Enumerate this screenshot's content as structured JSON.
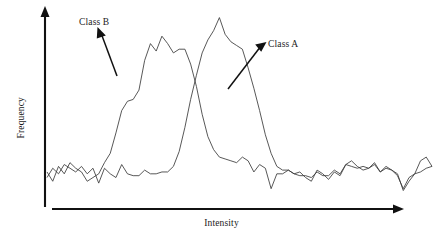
{
  "figure": {
    "background": "#ffffff",
    "axis_color": "#111111",
    "curve_color": "#3a3a3a"
  },
  "axes": {
    "x_label": "Intensity",
    "y_label": "Frequency",
    "x_axis_name": "x-axis-arrow",
    "y_axis_name": "y-axis-arrow"
  },
  "annotations": [
    {
      "label": "Class B",
      "target": "class-b-curve"
    },
    {
      "label": "Class A",
      "target": "class-a-curve"
    }
  ],
  "labels": {
    "class_a": "Class A",
    "class_b": "Class B"
  },
  "chart_data": {
    "type": "line",
    "title": "",
    "subtitle": "",
    "xlabel": "Intensity",
    "ylabel": "Frequency",
    "grid": false,
    "legend_position": "inline-annotations",
    "axis_style": "arrow-axes-no-ticks",
    "xlim": [
      0,
      100
    ],
    "ylim": [
      0,
      100
    ],
    "x": [
      0,
      1.49,
      2.99,
      4.48,
      5.97,
      7.46,
      8.96,
      10.45,
      11.94,
      13.43,
      14.93,
      16.42,
      17.91,
      19.4,
      20.9,
      22.39,
      23.88,
      25.37,
      26.87,
      28.36,
      29.85,
      31.34,
      32.84,
      34.33,
      35.82,
      37.31,
      38.81,
      40.3,
      41.79,
      43.28,
      44.78,
      46.27,
      47.76,
      49.25,
      50.75,
      52.24,
      53.73,
      55.22,
      56.72,
      58.21,
      59.7,
      61.19,
      62.69,
      64.18,
      65.67,
      67.16,
      68.66,
      70.15,
      71.64,
      73.13,
      74.63,
      76.12,
      77.61,
      79.1,
      80.6,
      82.09,
      83.58,
      85.07,
      86.57,
      88.06,
      89.55,
      91.04,
      92.54,
      94.03,
      95.52,
      97.01,
      98.51,
      100
    ],
    "series": [
      {
        "name": "Class B",
        "values": [
          14,
          9,
          17,
          13,
          19,
          16,
          14,
          9,
          11,
          13,
          19,
          24,
          35,
          47,
          52,
          53,
          58,
          74,
          83,
          79,
          87,
          83,
          78,
          80,
          80,
          72,
          60,
          45,
          33,
          26,
          22,
          21,
          20,
          19,
          22,
          20,
          14,
          18,
          16,
          5,
          13,
          13,
          15,
          13,
          14,
          11,
          9,
          15,
          13,
          10,
          14,
          12,
          18,
          20,
          17,
          15,
          16,
          19,
          14,
          16,
          15,
          13,
          4,
          9,
          13,
          20,
          22,
          17
        ]
      },
      {
        "name": "Class A",
        "values": [
          11,
          16,
          13,
          18,
          16,
          14,
          17,
          13,
          16,
          8,
          16,
          13,
          11,
          18,
          13,
          12,
          12,
          15,
          13,
          13,
          14,
          14,
          17,
          25,
          38,
          53,
          66,
          78,
          85,
          90,
          97,
          88,
          84,
          82,
          80,
          70,
          59,
          47,
          34,
          24,
          17,
          15,
          15,
          13,
          12,
          12,
          11,
          14,
          12,
          12,
          15,
          13,
          18,
          17,
          16,
          17,
          16,
          18,
          14,
          17,
          15,
          12,
          5,
          11,
          13,
          14,
          16,
          17
        ]
      }
    ],
    "annotations": [
      {
        "text": "Class B",
        "points_to_series": "Class B"
      },
      {
        "text": "Class A",
        "points_to_series": "Class A"
      }
    ]
  }
}
